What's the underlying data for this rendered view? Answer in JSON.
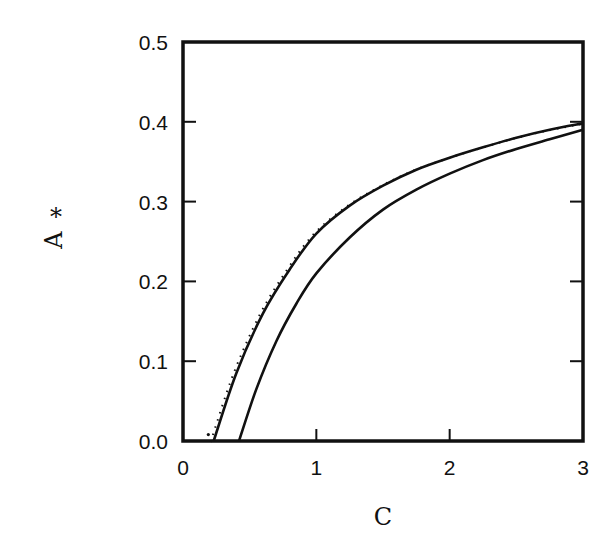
{
  "chart_data": {
    "type": "line",
    "title": "",
    "xlabel": "C",
    "ylabel": "A*",
    "xlim": [
      0,
      3
    ],
    "ylim": [
      0,
      0.5
    ],
    "grid": false,
    "legend": null,
    "xticks": [
      "0",
      "1",
      "2",
      "3"
    ],
    "yticks": [
      "0.0",
      "0.1",
      "0.2",
      "0.3",
      "0.4",
      "0.5"
    ],
    "series": [
      {
        "name": "outer curve (solid with dotted overlay)",
        "style": "solid+dotted",
        "x": [
          0.23,
          0.4,
          0.6,
          0.8,
          1.0,
          1.25,
          1.5,
          1.75,
          2.0,
          2.25,
          2.5,
          2.75,
          3.0
        ],
        "y": [
          0.0,
          0.085,
          0.16,
          0.215,
          0.26,
          0.295,
          0.32,
          0.34,
          0.355,
          0.368,
          0.38,
          0.39,
          0.398
        ]
      },
      {
        "name": "inner curve (solid)",
        "style": "solid",
        "x": [
          0.42,
          0.55,
          0.7,
          0.85,
          1.0,
          1.25,
          1.5,
          1.75,
          2.0,
          2.25,
          2.5,
          2.75,
          3.0
        ],
        "y": [
          0.0,
          0.065,
          0.125,
          0.172,
          0.21,
          0.255,
          0.29,
          0.315,
          0.335,
          0.352,
          0.366,
          0.378,
          0.39
        ]
      }
    ]
  }
}
